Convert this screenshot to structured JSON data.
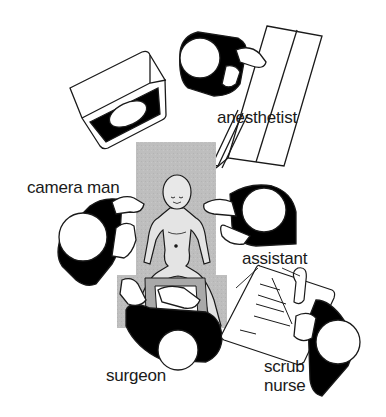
{
  "diagram": {
    "colors": {
      "table": "#bdbdbd",
      "line": "#1a1a1a",
      "fill_black": "#000000",
      "background": "#ffffff"
    },
    "objects": [
      {
        "id": "monitor",
        "icon": "monitor-icon"
      },
      {
        "id": "operating-table",
        "icon": "table-icon"
      },
      {
        "id": "patient",
        "icon": "patient-icon"
      },
      {
        "id": "anesthesia-cart",
        "icon": "cart-icon"
      },
      {
        "id": "instrument-tray",
        "icon": "tray-icon"
      }
    ],
    "labels": {
      "anesthetist": "anesthetist",
      "camera_man": "camera man",
      "assistant": "assistant",
      "surgeon": "surgeon",
      "scrub_line1": "scrub",
      "scrub_line2": "nurse"
    }
  }
}
